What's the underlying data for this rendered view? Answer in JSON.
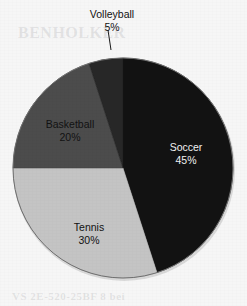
{
  "page": {
    "background_color": "#f6f6f6",
    "width": 247,
    "height": 306
  },
  "chart_data": {
    "type": "pie",
    "title": "",
    "subtitle": "",
    "xlabel": "",
    "ylabel": "",
    "legend_position": "none",
    "grid": false,
    "labels_inside": true,
    "start_angle_deg": 0,
    "direction": "clockwise",
    "categories": [
      "Soccer",
      "Tennis",
      "Basketball",
      "Volleyball"
    ],
    "values": [
      45,
      30,
      20,
      5
    ],
    "value_suffix": "%",
    "slices": [
      {
        "name": "Soccer",
        "label": "Soccer",
        "value": 45,
        "value_text": "45%",
        "color": "#121212",
        "text_color": "#f2f2f2",
        "start_deg": 0,
        "end_deg": 162,
        "label_placement": "inside"
      },
      {
        "name": "Tennis",
        "label": "Tennis",
        "value": 30,
        "value_text": "30%",
        "color": "#c4c4c4",
        "text_color": "#121212",
        "start_deg": 162,
        "end_deg": 270,
        "label_placement": "inside"
      },
      {
        "name": "Basketball",
        "label": "Basketball",
        "value": 20,
        "value_text": "20%",
        "color": "#4c4c4c",
        "text_color": "#121212",
        "start_deg": 270,
        "end_deg": 342,
        "label_placement": "inside"
      },
      {
        "name": "Volleyball",
        "label": "Volleyball",
        "value": 5,
        "value_text": "5%",
        "color": "#272727",
        "text_color": "#121212",
        "start_deg": 342,
        "end_deg": 360,
        "label_placement": "callout"
      }
    ],
    "geometry": {
      "center_x": 123,
      "center_y": 168,
      "radius": 110
    }
  },
  "ghost_text": {
    "top": "BENHOLKER",
    "bottom": "VS 2E-520-25BF 8 bei"
  }
}
